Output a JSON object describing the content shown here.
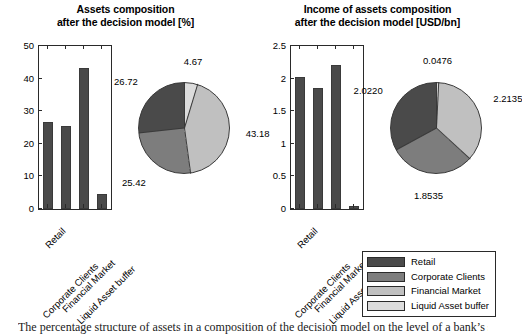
{
  "figure": {
    "caption": "The percentage structure of assets in a composition of the decision model on the level of a bank’s segments"
  },
  "palette": {
    "retail": "#4a4a4a",
    "corporate_clients": "#7d7d7d",
    "financial_market": "#c0c0c0",
    "liquid_asset_buffer": "#dcdcdc",
    "bar_fill": "#4a4a4a",
    "axis": "#2a2a2a"
  },
  "legend": {
    "name": "asset-segment-legend",
    "items": [
      {
        "label": "Retail",
        "color": "#4a4a4a"
      },
      {
        "label": "Corporate Clients",
        "color": "#7d7d7d"
      },
      {
        "label": "Financial Market",
        "color": "#c0c0c0"
      },
      {
        "label": "Liquid Asset buffer",
        "color": "#dcdcdc"
      }
    ]
  },
  "panels": [
    {
      "id": "assets-composition",
      "title_line1": "Assets composition",
      "title_line2": "after the decision model [%]"
    },
    {
      "id": "income-of-assets-composition",
      "title_line1": "Income of assets composition",
      "title_line2": "after the decision model [USD/bn]"
    }
  ],
  "chart_data": [
    {
      "id": "assets-composition-bar",
      "type": "bar",
      "title": "Assets composition after the decision model [%]",
      "xlabel": "",
      "ylabel": "",
      "ylim": [
        0,
        50
      ],
      "yticks": [
        0,
        10,
        20,
        30,
        40,
        50
      ],
      "ytick_labels": [
        "0",
        "10",
        "20",
        "30",
        "40",
        "50"
      ],
      "grid": false,
      "categories": [
        "Retail",
        "Corporate Clients",
        "Financial Market",
        "Liquid Asset buffer"
      ],
      "values": [
        26.72,
        25.42,
        43.18,
        4.67
      ],
      "bar_color": "#4a4a4a"
    },
    {
      "id": "assets-composition-pie",
      "type": "pie",
      "title": "Assets composition after the decision model [%]",
      "unit": "%",
      "start_angle_deg": 0,
      "direction": "clockwise",
      "legend_position": "bottom-right",
      "labels": [
        "Liquid Asset buffer",
        "Financial Market",
        "Corporate Clients",
        "Retail"
      ],
      "values": [
        4.67,
        43.18,
        25.42,
        26.72
      ],
      "value_labels": [
        "4.67",
        "43.18",
        "25.42",
        "26.72"
      ],
      "colors": [
        "#dcdcdc",
        "#c0c0c0",
        "#7d7d7d",
        "#4a4a4a"
      ]
    },
    {
      "id": "income-of-assets-composition-bar",
      "type": "bar",
      "title": "Income of assets composition after the decision model [USD/bn]",
      "xlabel": "",
      "ylabel": "",
      "ylim": [
        0,
        2.5
      ],
      "yticks": [
        0,
        0.5,
        1,
        1.5,
        2,
        2.5
      ],
      "ytick_labels": [
        "0",
        "0.5",
        "1",
        "1.5",
        "2",
        "2.5"
      ],
      "grid": false,
      "categories": [
        "Retail",
        "Corporate Clients",
        "Financial Market",
        "Liquid Asset buffer"
      ],
      "values": [
        2.022,
        1.8535,
        2.2135,
        0.0476
      ],
      "bar_color": "#4a4a4a"
    },
    {
      "id": "income-of-assets-composition-pie",
      "type": "pie",
      "title": "Income of assets composition after the decision model [USD/bn]",
      "unit": "USD/bn",
      "start_angle_deg": 0,
      "direction": "clockwise",
      "legend_position": "bottom-right",
      "labels": [
        "Liquid Asset buffer",
        "Financial Market",
        "Corporate Clients",
        "Retail"
      ],
      "values": [
        0.0476,
        2.2135,
        1.8535,
        2.022
      ],
      "value_labels": [
        "0.0476",
        "2.2135",
        "1.8535",
        "2.0220"
      ],
      "colors": [
        "#dcdcdc",
        "#c0c0c0",
        "#7d7d7d",
        "#4a4a4a"
      ]
    }
  ]
}
